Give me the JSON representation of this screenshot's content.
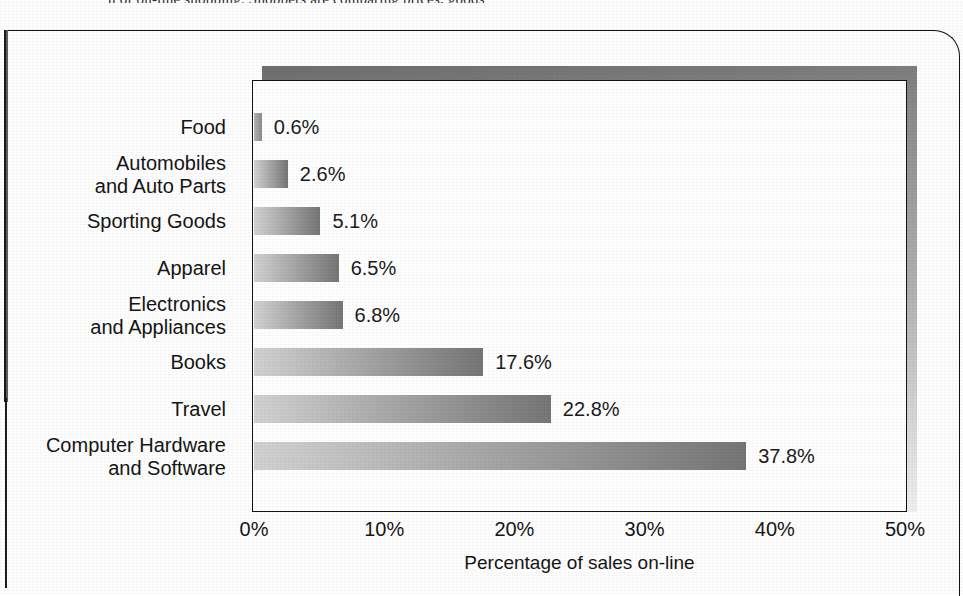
{
  "page": {
    "top_clipped_caption": "n of on-line shopping. Shoppers are comparing prices, goods"
  },
  "chart_data": {
    "type": "bar",
    "orientation": "horizontal",
    "title": "",
    "xlabel": "Percentage of sales on-line",
    "ylabel": "",
    "xlim": [
      0,
      50
    ],
    "xtick_labels": [
      "0%",
      "10%",
      "20%",
      "30%",
      "40%",
      "50%"
    ],
    "xtick_values": [
      0,
      10,
      20,
      30,
      40,
      50
    ],
    "grid": false,
    "legend": false,
    "categories": [
      "Food",
      "Automobiles\nand Auto Parts",
      "Sporting Goods",
      "Apparel",
      "Electronics\nand Appliances",
      "Books",
      "Travel",
      "Computer Hardware\nand Software"
    ],
    "values": [
      0.6,
      2.6,
      5.1,
      6.5,
      6.8,
      17.6,
      22.8,
      37.8
    ],
    "value_labels": [
      "0.6%",
      "2.6%",
      "5.1%",
      "6.5%",
      "6.8%",
      "17.6%",
      "22.8%",
      "37.8%"
    ],
    "rows": [
      {
        "label_line1": "Food",
        "label_line2": "",
        "value": 0.6,
        "value_label": "0.6%"
      },
      {
        "label_line1": "Automobiles",
        "label_line2": "and Auto Parts",
        "value": 2.6,
        "value_label": "2.6%"
      },
      {
        "label_line1": "Sporting Goods",
        "label_line2": "",
        "value": 5.1,
        "value_label": "5.1%"
      },
      {
        "label_line1": "Apparel",
        "label_line2": "",
        "value": 6.5,
        "value_label": "6.5%"
      },
      {
        "label_line1": "Electronics",
        "label_line2": "and Appliances",
        "value": 6.8,
        "value_label": "6.8%"
      },
      {
        "label_line1": "Books",
        "label_line2": "",
        "value": 17.6,
        "value_label": "17.6%"
      },
      {
        "label_line1": "Travel",
        "label_line2": "",
        "value": 22.8,
        "value_label": "22.8%"
      },
      {
        "label_line1": "Computer Hardware",
        "label_line2": "and Software",
        "value": 37.8,
        "value_label": "37.8%"
      }
    ],
    "colors": {
      "bar_gradient_start": "#d2d2d2",
      "bar_gradient_end": "#767676",
      "plot_border": "#131313",
      "plot_background": "#ffffff",
      "text": "#161616",
      "shadow_dark": "#6e6e6e",
      "shadow_light": "#efefef"
    }
  }
}
